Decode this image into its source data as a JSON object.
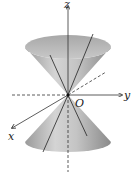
{
  "figure": {
    "labels": {
      "z_axis": "z",
      "y_axis": "y",
      "x_axis": "x",
      "origin": "O"
    },
    "colors": {
      "cone_light": "#d9d9d9",
      "cone_mid": "#b5b5b5",
      "cone_dark": "#8c8c8c",
      "axis": "#333333",
      "background": "#ffffff"
    }
  }
}
